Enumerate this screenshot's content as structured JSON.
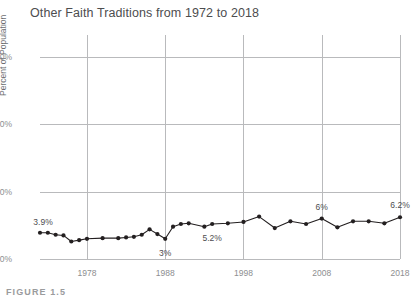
{
  "figure": {
    "caption": "FIGURE 1.5"
  },
  "chart_data": {
    "type": "line",
    "title": "Other Faith Traditions from 1972 to 2018",
    "xlabel": "",
    "ylabel": "Percent of Population",
    "xlim": [
      1972,
      2018
    ],
    "ylim": [
      0,
      30
    ],
    "grid": true,
    "legend": "none",
    "y_ticks": [
      "0%",
      "10%",
      "20%",
      "30%"
    ],
    "y_tick_values": [
      0,
      10,
      20,
      30
    ],
    "x_ticks": [
      "1978",
      "1988",
      "1998",
      "2008",
      "2018"
    ],
    "x_tick_values": [
      1978,
      1988,
      1998,
      2008,
      2018
    ],
    "x": [
      1972,
      1973,
      1974,
      1975,
      1976,
      1977,
      1978,
      1980,
      1982,
      1983,
      1984,
      1985,
      1986,
      1987,
      1988,
      1989,
      1990,
      1991,
      1993,
      1994,
      1996,
      1998,
      2000,
      2002,
      2004,
      2006,
      2008,
      2010,
      2012,
      2014,
      2016,
      2018
    ],
    "values": [
      3.9,
      3.9,
      3.6,
      3.5,
      2.6,
      2.8,
      3.0,
      3.1,
      3.1,
      3.2,
      3.3,
      3.6,
      4.4,
      3.7,
      3.0,
      4.8,
      5.2,
      5.3,
      4.8,
      5.2,
      5.3,
      5.5,
      6.3,
      4.6,
      5.6,
      5.2,
      6.0,
      4.7,
      5.6,
      5.6,
      5.3,
      6.2
    ],
    "annotations": [
      {
        "label": "3.9%",
        "x": 1972,
        "y": 3.9,
        "position": "above-left"
      },
      {
        "label": "3%",
        "x": 1988,
        "y": 3.0,
        "position": "below"
      },
      {
        "label": "5.2%",
        "x": 1994,
        "y": 5.2,
        "position": "below"
      },
      {
        "label": "6%",
        "x": 2008,
        "y": 6.0,
        "position": "above"
      },
      {
        "label": "6.2%",
        "x": 2018,
        "y": 6.2,
        "position": "above"
      }
    ],
    "series_color": "#231f20",
    "grid_color": "#b9babc",
    "marker": "circle"
  }
}
